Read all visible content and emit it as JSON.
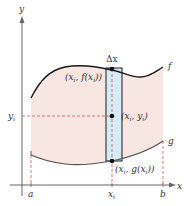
{
  "diagram": {
    "type": "area-between-curves",
    "colors": {
      "region_fill": "#f8e6e3",
      "strip_fill": "#d6ebf5",
      "curve": "#1a1a1a",
      "g_curve": "#555555",
      "axis": "#666666",
      "dashed": "#d9534f",
      "dot": "#111111"
    },
    "axes": {
      "x_label": "x",
      "y_label": "y"
    },
    "curves": {
      "f_label": "f",
      "g_label": "g"
    },
    "x_ticks": {
      "a": "a",
      "x_i": "x",
      "x_i_sub": "i",
      "b": "b"
    },
    "y_ticks": {
      "y_i": "y",
      "y_i_sub": "i"
    },
    "strip": {
      "width_label": "Δx"
    },
    "points": {
      "top": {
        "label_pre": "(x",
        "sub1": "i",
        "mid": ", f(x",
        "sub2": "i",
        "post": "))"
      },
      "middle": {
        "label_pre": "(x",
        "sub1": "i",
        "mid": ", y",
        "sub2": "i",
        "post": ")"
      },
      "bottom": {
        "label_pre": "(x",
        "sub1": "i",
        "mid": ", g(x",
        "sub2": "i",
        "post": "))"
      }
    }
  }
}
